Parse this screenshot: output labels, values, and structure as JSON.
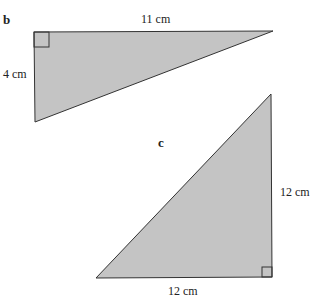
{
  "figures": [
    {
      "id": "b",
      "label": "b",
      "type": "right-triangle",
      "sides": {
        "top": "11 cm",
        "left": "4 cm"
      },
      "fill": "#c4c4c4",
      "stroke": "#333333"
    },
    {
      "id": "c",
      "label": "c",
      "type": "right-triangle",
      "sides": {
        "right": "12 cm",
        "bottom": "12 cm"
      },
      "fill": "#c4c4c4",
      "stroke": "#333333"
    }
  ]
}
